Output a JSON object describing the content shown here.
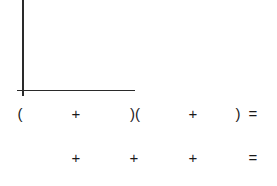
{
  "area_model": {
    "vertical_side": "",
    "horizontal_side": ""
  },
  "expression_row": {
    "open_paren_1": "(",
    "plus_1": "+",
    "close_open_paren": ")(",
    "plus_2": "+",
    "close_paren_2": ")",
    "equals": "="
  },
  "sum_row": {
    "plus_1": "+",
    "plus_2": "+",
    "plus_3": "+",
    "equals": "="
  }
}
